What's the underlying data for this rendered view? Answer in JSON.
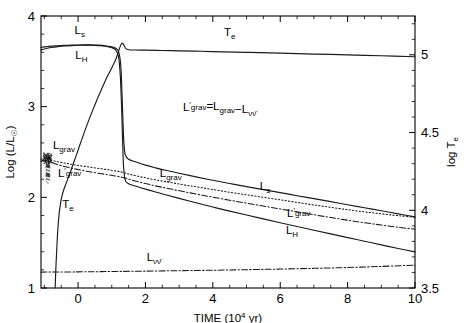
{
  "chart_data": {
    "type": "line",
    "title": "",
    "xlabel": "TIME (10^4 yr)",
    "xlabel_base": "TIME (10",
    "xlabel_exp": "4",
    "xlabel_tail": " yr)",
    "ylabel_left": "Log (L/L☉)",
    "ylabel_left_base": "Log (L/L",
    "ylabel_left_sub": "☉",
    "ylabel_left_tail": ")",
    "ylabel_right": "log T_e",
    "ylabel_right_base": "log T",
    "ylabel_right_sub": "e",
    "xlim": [
      -1.1,
      10.0
    ],
    "ylim_left": [
      1.0,
      4.0
    ],
    "ylim_right": [
      3.5,
      5.25
    ],
    "xticks": [
      0,
      2,
      4,
      6,
      8,
      10
    ],
    "xticklabels": [
      "0",
      "2",
      "4",
      "6",
      "8",
      "10"
    ],
    "yticks_left": [
      1,
      2,
      3,
      4
    ],
    "yticklabels_left": [
      "1",
      "2",
      "3",
      "4"
    ],
    "yticks_right": [
      3.5,
      4,
      4.5,
      5
    ],
    "yticklabels_right": [
      "3.5",
      "4",
      "4.5",
      "5"
    ],
    "xminor_step": 0.5,
    "yminor_left_step": 0.2,
    "yminor_right_step": 0.1,
    "grid": false,
    "legend": "none",
    "annotation": {
      "text": "L'_grav = L_grav − L_νν̄",
      "parts": [
        "L",
        "′",
        "grav",
        "=L",
        "grav",
        "−L",
        "νν̄"
      ],
      "x": 4.2,
      "y": 2.95
    },
    "series": [
      {
        "name": "L_s",
        "label": "L",
        "label_sub": "s",
        "style": "solid",
        "axis": "left",
        "label_positions": [
          {
            "x": 0.05,
            "y": 3.8
          },
          {
            "x": 5.55,
            "y": 2.08
          }
        ],
        "x": [
          -1.1,
          -1.0,
          -0.9,
          -0.8,
          -0.6,
          -0.4,
          -0.2,
          0.0,
          0.2,
          0.4,
          0.6,
          0.8,
          1.0,
          1.1,
          1.15,
          1.2,
          1.25,
          1.28,
          1.3,
          1.33,
          1.36,
          1.4,
          1.5,
          1.7,
          2.0,
          2.3,
          2.6,
          3.0,
          3.5,
          4.0,
          4.5,
          5.0,
          5.5,
          6.0,
          6.5,
          7.0,
          7.5,
          8.0,
          8.5,
          9.0,
          9.5,
          10.0
        ],
        "y": [
          3.655,
          3.66,
          3.664,
          3.668,
          3.672,
          3.676,
          3.678,
          3.68,
          3.681,
          3.681,
          3.678,
          3.672,
          3.66,
          3.648,
          3.636,
          3.61,
          3.52,
          3.38,
          3.18,
          2.87,
          2.6,
          2.47,
          2.42,
          2.392,
          2.355,
          2.325,
          2.298,
          2.265,
          2.225,
          2.188,
          2.153,
          2.118,
          2.085,
          2.052,
          2.018,
          1.985,
          1.952,
          1.918,
          1.885,
          1.852,
          1.818,
          1.785
        ]
      },
      {
        "name": "L_H",
        "label": "L",
        "label_sub": "H",
        "style": "solid",
        "axis": "left",
        "label_positions": [
          {
            "x": 0.1,
            "y": 3.53
          },
          {
            "x": 6.35,
            "y": 1.6
          }
        ],
        "x": [
          -1.1,
          -1.0,
          -0.9,
          -0.8,
          -0.6,
          -0.4,
          -0.2,
          0.0,
          0.2,
          0.4,
          0.6,
          0.8,
          1.0,
          1.1,
          1.15,
          1.2,
          1.23,
          1.26,
          1.29,
          1.32,
          1.35,
          1.4,
          1.5,
          1.7,
          2.0,
          2.3,
          2.6,
          3.0,
          3.5,
          4.0,
          4.5,
          5.0,
          5.5,
          6.0,
          6.5,
          7.0,
          7.5,
          8.0,
          8.5,
          9.0,
          9.5,
          10.0
        ],
        "y": [
          3.625,
          3.636,
          3.645,
          3.652,
          3.662,
          3.669,
          3.674,
          3.677,
          3.678,
          3.677,
          3.673,
          3.666,
          3.65,
          3.63,
          3.605,
          3.555,
          3.46,
          3.3,
          3.02,
          2.65,
          2.34,
          2.19,
          2.15,
          2.125,
          2.09,
          2.058,
          2.028,
          1.988,
          1.94,
          1.893,
          1.848,
          1.805,
          1.762,
          1.72,
          1.678,
          1.637,
          1.597,
          1.556,
          1.516,
          1.476,
          1.436,
          1.398
        ]
      },
      {
        "name": "L_grav",
        "label": "L",
        "label_sub": "grav",
        "style": "dotted",
        "axis": "left",
        "label_positions": [
          {
            "x": -0.42,
            "y": 2.53
          },
          {
            "x": 2.75,
            "y": 2.22
          }
        ],
        "x": [
          -1.1,
          -1.0,
          -0.95,
          -0.9,
          -0.85,
          -0.8,
          -0.7,
          -0.6,
          -0.4,
          -0.2,
          0.0,
          0.3,
          0.6,
          0.9,
          1.1,
          1.2,
          1.25,
          1.3,
          1.4,
          1.6,
          2.0,
          2.4,
          2.8,
          3.2,
          3.6,
          4.0,
          4.5,
          5.0,
          5.5,
          6.0,
          6.5,
          7.0,
          7.5,
          8.0,
          8.5,
          9.0,
          9.5,
          10.0
        ],
        "y": [
          2.42,
          2.43,
          2.432,
          2.428,
          2.42,
          2.412,
          2.4,
          2.392,
          2.378,
          2.364,
          2.352,
          2.336,
          2.32,
          2.304,
          2.292,
          2.286,
          2.282,
          2.278,
          2.268,
          2.248,
          2.215,
          2.186,
          2.16,
          2.134,
          2.11,
          2.086,
          2.056,
          2.028,
          2.0,
          1.972,
          1.944,
          1.916,
          1.89,
          1.864,
          1.84,
          1.818,
          1.798,
          1.78
        ]
      },
      {
        "name": "Lprime_grav",
        "label": "L",
        "label_prime": "′",
        "label_sub": "grav",
        "style": "dashdot",
        "axis": "left",
        "label_positions": [
          {
            "x": -0.25,
            "y": 2.22
          },
          {
            "x": 6.55,
            "y": 1.78
          }
        ],
        "x": [
          -1.1,
          -1.0,
          -0.95,
          -0.9,
          -0.85,
          -0.8,
          -0.7,
          -0.6,
          -0.4,
          -0.2,
          0.0,
          0.3,
          0.6,
          0.9,
          1.1,
          1.2,
          1.25,
          1.3,
          1.4,
          1.6,
          2.0,
          2.4,
          2.8,
          3.2,
          3.6,
          4.0,
          4.5,
          5.0,
          5.5,
          6.0,
          6.5,
          7.0,
          7.5,
          8.0,
          8.5,
          9.0,
          9.5,
          10.0
        ],
        "y": [
          2.4,
          2.412,
          2.414,
          2.408,
          2.398,
          2.388,
          2.372,
          2.36,
          2.34,
          2.322,
          2.306,
          2.285,
          2.266,
          2.248,
          2.236,
          2.23,
          2.226,
          2.222,
          2.212,
          2.19,
          2.152,
          2.118,
          2.088,
          2.058,
          2.03,
          2.002,
          1.968,
          1.936,
          1.904,
          1.872,
          1.84,
          1.808,
          1.778,
          1.748,
          1.72,
          1.694,
          1.67,
          1.648
        ]
      },
      {
        "name": "L_nunubar",
        "label": "L",
        "label_sub": "νν̄",
        "style": "dashdot",
        "axis": "left",
        "label_positions": [
          {
            "x": 2.25,
            "y": 1.3
          }
        ],
        "x": [
          -1.1,
          0.0,
          1.0,
          2.0,
          3.0,
          4.0,
          5.0,
          6.0,
          7.0,
          8.0,
          9.0,
          10.0
        ],
        "y": [
          1.175,
          1.178,
          1.182,
          1.186,
          1.191,
          1.196,
          1.202,
          1.209,
          1.217,
          1.226,
          1.238,
          1.252
        ]
      },
      {
        "name": "T_e",
        "label": "T",
        "label_sub": "e",
        "style": "solid",
        "axis": "right",
        "label_positions": [
          {
            "x": -0.3,
            "y_left": 1.88
          },
          {
            "x": 4.5,
            "y_left": 3.78
          }
        ],
        "x": [
          -0.68,
          -0.66,
          -0.63,
          -0.6,
          -0.56,
          -0.52,
          -0.48,
          -0.42,
          -0.36,
          -0.3,
          -0.22,
          -0.15,
          -0.05,
          0.1,
          0.25,
          0.4,
          0.55,
          0.7,
          0.85,
          0.95,
          1.02,
          1.08,
          1.12,
          1.16,
          1.2,
          1.24,
          1.28,
          1.32,
          1.36,
          1.42,
          1.5,
          1.7,
          2.0,
          2.5,
          3.0,
          3.5,
          4.0,
          5.0,
          6.0,
          7.0,
          8.0,
          9.0,
          10.0
        ],
        "y_right": [
          3.5,
          3.62,
          3.76,
          3.88,
          3.98,
          4.045,
          4.09,
          4.135,
          4.17,
          4.205,
          4.25,
          4.295,
          4.355,
          4.45,
          4.54,
          4.625,
          4.705,
          4.78,
          4.852,
          4.895,
          4.925,
          4.952,
          4.972,
          4.996,
          5.022,
          5.048,
          5.068,
          5.075,
          5.062,
          5.04,
          5.033,
          5.031,
          5.03,
          5.028,
          5.026,
          5.024,
          5.021,
          5.016,
          5.011,
          5.005,
          5.0,
          4.994,
          4.988
        ]
      }
    ],
    "noise_region": {
      "description": "scattered noisy points near t = -0.95 on L_grav branch",
      "x_center": -0.93,
      "y_center": 2.43
    }
  }
}
